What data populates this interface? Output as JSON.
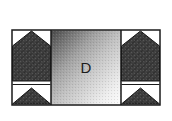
{
  "figure": {
    "name": "three-panel-cross-section-diagram",
    "canvas": {
      "width": 172,
      "height": 121,
      "background": "#ffffff"
    },
    "frame": {
      "x": 12,
      "y": 30,
      "width": 148,
      "height": 75,
      "border_color": "#1a1a1a",
      "border_width": 1.5,
      "fill": "#ffffff"
    },
    "dividers": [
      {
        "name": "divider-left",
        "x": 51
      },
      {
        "name": "divider-right",
        "x": 121
      }
    ],
    "panels": [
      {
        "name": "left-panel",
        "x": 12,
        "width": 39,
        "fill": "#ffffff",
        "shape_fill": "#3b3b3b",
        "shape_edge": "#111111",
        "hatch": "crosshatch"
      },
      {
        "name": "center-panel",
        "x": 51,
        "width": 70,
        "label": "D",
        "label_color": "#1c1c1c",
        "gradient": {
          "type": "linear-diagonal",
          "angle_deg": 135,
          "from": "#4a4a4a",
          "mid": "#b9b9b9",
          "to": "#fbfbfb"
        }
      },
      {
        "name": "right-panel",
        "x": 121,
        "width": 39,
        "fill": "#ffffff",
        "shape_fill": "#3b3b3b",
        "shape_edge": "#111111",
        "hatch": "crosshatch"
      }
    ],
    "labels": [
      {
        "name": "center-region-label",
        "text": "D",
        "x": 86,
        "y": 68
      }
    ]
  }
}
